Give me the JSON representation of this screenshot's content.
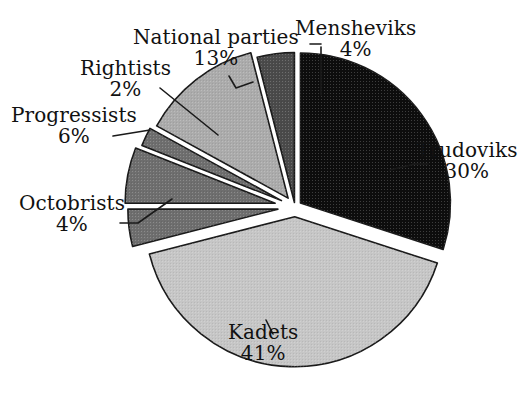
{
  "chart_data": {
    "type": "pie",
    "title": "",
    "subtitle": "",
    "xlabel": "",
    "ylabel": "",
    "legend_position": "none",
    "grid": false,
    "value_unit": "%",
    "total": 100,
    "categories": [
      "Trudoviks",
      "Kadets",
      "Octobrists",
      "Progressists",
      "Rightists",
      "National parties",
      "Mensheviks"
    ],
    "values": [
      30,
      41,
      4,
      6,
      2,
      13,
      4
    ],
    "slices": [
      {
        "label": "Trudoviks",
        "value": 30,
        "value_text": "30%",
        "color": "#0d0d0d",
        "start_angle": 0,
        "end_angle": 108,
        "explode": 0.045,
        "label_anchor": "start"
      },
      {
        "label": "Kadets",
        "value": 41,
        "value_text": "41%",
        "color": "#c6c6c6",
        "start_angle": 108,
        "end_angle": 255.6,
        "explode": 0.065,
        "label_anchor": "middle"
      },
      {
        "label": "Octobrists",
        "value": 4,
        "value_text": "4%",
        "color": "#6e6e6e",
        "start_angle": 255.6,
        "end_angle": 270.0,
        "explode": 0.115,
        "label_anchor": "end"
      },
      {
        "label": "Progressists",
        "value": 6,
        "value_text": "6%",
        "color": "#6e6e6e",
        "start_angle": 270.0,
        "end_angle": 291.6,
        "explode": 0.135,
        "label_anchor": "end"
      },
      {
        "label": "Rightists",
        "value": 2,
        "value_text": "2%",
        "color": "#6e6e6e",
        "start_angle": 291.6,
        "end_angle": 298.8,
        "explode": 0.1,
        "label_anchor": "end"
      },
      {
        "label": "National parties",
        "value": 13,
        "value_text": "13%",
        "color": "#ababab",
        "start_angle": 298.8,
        "end_angle": 345.6,
        "explode": 0.075,
        "label_anchor": "middle"
      },
      {
        "label": "Mensheviks",
        "value": 4,
        "value_text": "4%",
        "color": "#4a4a4a",
        "start_angle": 345.6,
        "end_angle": 360,
        "explode": 0.03,
        "label_anchor": "middle"
      }
    ],
    "geometry": {
      "center_x": 295,
      "center_y": 207,
      "radius": 150
    }
  },
  "labels": {
    "mensheviks": {
      "name": "Mensheviks",
      "value": "4%"
    },
    "national_parties": {
      "name": "National parties",
      "value": "13%"
    },
    "rightists": {
      "name": "Rightists",
      "value": "2%"
    },
    "progressists": {
      "name": "Progressists",
      "value": "6%"
    },
    "octobrists": {
      "name": "Octobrists",
      "value": "4%"
    },
    "trudoviks": {
      "name": "Trudoviks",
      "value": "30%"
    },
    "kadets": {
      "name": "Kadets",
      "value": "41%"
    }
  },
  "colors": {
    "background": "#ffffff",
    "outline": "#1a1a1a",
    "text": "#111111",
    "black_slice": "#0d0d0d",
    "dark_gray_slice": "#4a4a4a",
    "mid_gray_slice": "#6e6e6e",
    "gray_slice": "#ababab",
    "light_gray_slice": "#c6c6c6"
  }
}
